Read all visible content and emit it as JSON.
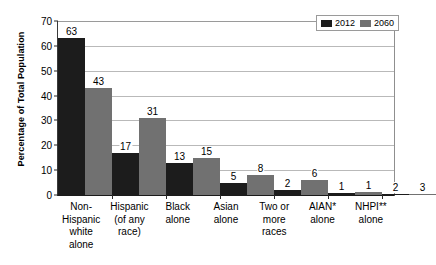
{
  "chart_data": {
    "type": "bar",
    "title": "",
    "xlabel": "",
    "ylabel": "Percentage of Total Population",
    "ylim": [
      0,
      70
    ],
    "ytick_step": 10,
    "yticks": [
      "0",
      "10",
      "20",
      "30",
      "40",
      "50",
      "60",
      "70"
    ],
    "grid": true,
    "legend_position": "top-right",
    "categories": [
      "Non-\nHispanic\nwhite\nalone",
      "Hispanic\n(of any\nrace)",
      "Black\nalone",
      "Asian\nalone",
      "Two or\nmore\nraces",
      "AIAN*\nalone",
      "NHPI**\nalone"
    ],
    "series": [
      {
        "name": "2012",
        "color": "#1c1c1c",
        "values": [
          63,
          17,
          13,
          5,
          2,
          1,
          2
        ]
      },
      {
        "name": "2060",
        "color": "#717171",
        "values": [
          43,
          31,
          15,
          8,
          6,
          1,
          3
        ]
      }
    ],
    "bar_render_heights": {
      "comment": "drawn pixel values relative to 0-70 axis as read off the plot",
      "2012": [
        63,
        17,
        13,
        5,
        2,
        1,
        0.3
      ],
      "2060": [
        43,
        31,
        15,
        8,
        6,
        1.2,
        0.4
      ]
    }
  },
  "legend": {
    "items": [
      {
        "label": "2012",
        "color": "#1c1c1c"
      },
      {
        "label": "2060",
        "color": "#717171"
      }
    ]
  },
  "axis": {
    "y_title": "Percentage of Total Population",
    "ticks": [
      "70",
      "60",
      "50",
      "40",
      "30",
      "20",
      "10",
      "0"
    ]
  },
  "xlabels": [
    {
      "lines": [
        "Non-",
        "Hispanic",
        "white",
        "alone"
      ]
    },
    {
      "lines": [
        "Hispanic",
        "(of any",
        "race)"
      ]
    },
    {
      "lines": [
        "Black",
        "alone"
      ]
    },
    {
      "lines": [
        "Asian",
        "alone"
      ]
    },
    {
      "lines": [
        "Two or",
        "more",
        "races"
      ]
    },
    {
      "lines": [
        "AIAN*",
        "alone"
      ]
    },
    {
      "lines": [
        "NHPI**",
        "alone"
      ]
    }
  ],
  "value_labels": {
    "2012": [
      "63",
      "17",
      "13",
      "5",
      "2",
      "1",
      "2"
    ],
    "2060": [
      "43",
      "31",
      "15",
      "8",
      "6",
      "1",
      "3"
    ]
  }
}
